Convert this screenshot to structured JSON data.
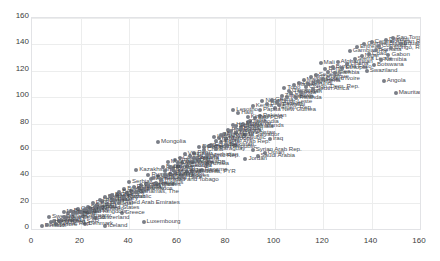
{
  "chart": {
    "title": "",
    "background": "#ffffff",
    "marker_color": "#6f737d",
    "grid_color": "#eceded",
    "label_color": "#4a4d55"
  },
  "chart_data": {
    "type": "scatter",
    "title": "",
    "xlabel": "",
    "ylabel": "",
    "xlim": [
      0,
      160
    ],
    "ylim": [
      0,
      160
    ],
    "xticks": [
      0,
      20,
      40,
      60,
      80,
      100,
      120,
      140,
      160
    ],
    "yticks": [
      0,
      20,
      40,
      60,
      80,
      100,
      120,
      140,
      160
    ],
    "grid": true,
    "legend": "none",
    "series": [
      {
        "name": "Countries",
        "points": [
          {
            "label": "Finland",
            "x": 4,
            "y": 2
          },
          {
            "label": "Iceland",
            "x": 30,
            "y": 2
          },
          {
            "label": "Denmark",
            "x": 22,
            "y": 4
          },
          {
            "label": "Korea, Rep.",
            "x": 10,
            "y": 4
          },
          {
            "label": "Luxembourg",
            "x": 46,
            "y": 5
          },
          {
            "label": "Switzerland",
            "x": 26,
            "y": 8
          },
          {
            "label": "Germany",
            "x": 21,
            "y": 10
          },
          {
            "label": "Austria",
            "x": 15,
            "y": 12
          },
          {
            "label": "Greece",
            "x": 37,
            "y": 12
          },
          {
            "label": "Czech Republic",
            "x": 19,
            "y": 15
          },
          {
            "label": "Netherlands",
            "x": 13,
            "y": 13
          },
          {
            "label": "Sweden",
            "x": 7,
            "y": 9
          },
          {
            "label": "Norway",
            "x": 9,
            "y": 6
          },
          {
            "label": "Japan",
            "x": 12,
            "y": 7
          },
          {
            "label": "Italy",
            "x": 24,
            "y": 16
          },
          {
            "label": "Spain",
            "x": 27,
            "y": 18
          },
          {
            "label": "Portugal",
            "x": 31,
            "y": 19
          },
          {
            "label": "Ireland",
            "x": 17,
            "y": 11
          },
          {
            "label": "Belgium",
            "x": 16,
            "y": 14
          },
          {
            "label": "France",
            "x": 18,
            "y": 12
          },
          {
            "label": "United Kingdom",
            "x": 20,
            "y": 13
          },
          {
            "label": "Slovenia",
            "x": 23,
            "y": 17
          },
          {
            "label": "Poland",
            "x": 29,
            "y": 21
          },
          {
            "label": "Estonia",
            "x": 25,
            "y": 20
          },
          {
            "label": "Hungary",
            "x": 33,
            "y": 23
          },
          {
            "label": "Slovak Republic",
            "x": 30,
            "y": 24
          },
          {
            "label": "Croatia",
            "x": 35,
            "y": 26
          },
          {
            "label": "Lithuania",
            "x": 28,
            "y": 22
          },
          {
            "label": "Latvia",
            "x": 32,
            "y": 25
          },
          {
            "label": "Chile",
            "x": 41,
            "y": 29
          },
          {
            "label": "Uruguay",
            "x": 44,
            "y": 31
          },
          {
            "label": "Argentina",
            "x": 47,
            "y": 34
          },
          {
            "label": "Cuba",
            "x": 39,
            "y": 27
          },
          {
            "label": "Costa Rica",
            "x": 45,
            "y": 33
          },
          {
            "label": "Bulgaria",
            "x": 38,
            "y": 30
          },
          {
            "label": "Romania",
            "x": 42,
            "y": 32
          },
          {
            "label": "Serbia",
            "x": 40,
            "y": 36
          },
          {
            "label": "Montenegro",
            "x": 49,
            "y": 38
          },
          {
            "label": "Belarus",
            "x": 36,
            "y": 28
          },
          {
            "label": "Russian Federation",
            "x": 48,
            "y": 41
          },
          {
            "label": "Kazakhstan",
            "x": 43,
            "y": 45
          },
          {
            "label": "Ukraine",
            "x": 52,
            "y": 40
          },
          {
            "label": "Uzbekistan",
            "x": 60,
            "y": 48
          },
          {
            "label": "Macedonia, FYR",
            "x": 64,
            "y": 43
          },
          {
            "label": "Albania",
            "x": 57,
            "y": 42
          },
          {
            "label": "Turkey",
            "x": 55,
            "y": 44
          },
          {
            "label": "Mexico",
            "x": 58,
            "y": 46
          },
          {
            "label": "Brazil",
            "x": 54,
            "y": 47
          },
          {
            "label": "Tunisia",
            "x": 72,
            "y": 49
          },
          {
            "label": "Panama",
            "x": 70,
            "y": 45
          },
          {
            "label": "Jamaica",
            "x": 66,
            "y": 44
          },
          {
            "label": "Venezuela, RB",
            "x": 62,
            "y": 50
          },
          {
            "label": "Thailand",
            "x": 59,
            "y": 52
          },
          {
            "label": "Colombia",
            "x": 61,
            "y": 54
          },
          {
            "label": "Malaysia",
            "x": 56,
            "y": 51
          },
          {
            "label": "Algeria",
            "x": 68,
            "y": 53
          },
          {
            "label": "Iran, Islamic Rep.",
            "x": 65,
            "y": 55
          },
          {
            "label": "Peru",
            "x": 67,
            "y": 58
          },
          {
            "label": "China",
            "x": 71,
            "y": 60
          },
          {
            "label": "Vietnam",
            "x": 63,
            "y": 57
          },
          {
            "label": "Dominican Republic",
            "x": 69,
            "y": 62
          },
          {
            "label": "Ecuador",
            "x": 74,
            "y": 64
          },
          {
            "label": "Mongolia",
            "x": 52,
            "y": 66
          },
          {
            "label": "Paraguay",
            "x": 76,
            "y": 61
          },
          {
            "label": "Sri Lanka",
            "x": 73,
            "y": 63
          },
          {
            "label": "Egypt, Arab Rep.",
            "x": 78,
            "y": 66
          },
          {
            "label": "Morocco",
            "x": 80,
            "y": 68
          },
          {
            "label": "Indonesia",
            "x": 75,
            "y": 70
          },
          {
            "label": "El Salvador",
            "x": 88,
            "y": 71
          },
          {
            "label": "Turkmenistan",
            "x": 84,
            "y": 73
          },
          {
            "label": "Philippines",
            "x": 81,
            "y": 75
          },
          {
            "label": "Guatemala",
            "x": 86,
            "y": 77
          },
          {
            "label": "Honduras",
            "x": 83,
            "y": 79
          },
          {
            "label": "Bolivia",
            "x": 79,
            "y": 72
          },
          {
            "label": "Nicaragua",
            "x": 82,
            "y": 74
          },
          {
            "label": "Kyrgyz Republic",
            "x": 77,
            "y": 69
          },
          {
            "label": "India",
            "x": 90,
            "y": 82
          },
          {
            "label": "Lao PDR",
            "x": 92,
            "y": 84
          },
          {
            "label": "Cambodia",
            "x": 89,
            "y": 81
          },
          {
            "label": "Myanmar",
            "x": 87,
            "y": 80
          },
          {
            "label": "Pakistan",
            "x": 94,
            "y": 86
          },
          {
            "label": "Haiti",
            "x": 85,
            "y": 88
          },
          {
            "label": "Lesotho",
            "x": 83,
            "y": 90
          },
          {
            "label": "Kenya",
            "x": 91,
            "y": 93
          },
          {
            "label": "Bangladesh",
            "x": 97,
            "y": 95
          },
          {
            "label": "Nepal",
            "x": 95,
            "y": 97
          },
          {
            "label": "Yemen, Rep.",
            "x": 100,
            "y": 92
          },
          {
            "label": "Ghana",
            "x": 99,
            "y": 98
          },
          {
            "label": "Zimbabwe",
            "x": 103,
            "y": 101
          },
          {
            "label": "Tanzania",
            "x": 105,
            "y": 100
          },
          {
            "label": "Uganda",
            "x": 107,
            "y": 103
          },
          {
            "label": "Rwanda",
            "x": 109,
            "y": 99
          },
          {
            "label": "Cameroon",
            "x": 106,
            "y": 105
          },
          {
            "label": "Togo",
            "x": 104,
            "y": 107
          },
          {
            "label": "Sudan",
            "x": 111,
            "y": 104
          },
          {
            "label": "Malawi",
            "x": 108,
            "y": 109
          },
          {
            "label": "Zambia",
            "x": 110,
            "y": 111
          },
          {
            "label": "Congo, Dem. Rep.",
            "x": 113,
            "y": 108
          },
          {
            "label": "South Africa",
            "x": 116,
            "y": 106
          },
          {
            "label": "Madagascar",
            "x": 112,
            "y": 113
          },
          {
            "label": "Mozambique",
            "x": 115,
            "y": 115
          },
          {
            "label": "Burundi",
            "x": 114,
            "y": 110
          },
          {
            "label": "Nigeria",
            "x": 118,
            "y": 112
          },
          {
            "label": "Senegal",
            "x": 117,
            "y": 117
          },
          {
            "label": "Cote d'Ivoire",
            "x": 120,
            "y": 114
          },
          {
            "label": "Guinea",
            "x": 122,
            "y": 119
          },
          {
            "label": "Benin",
            "x": 121,
            "y": 121
          },
          {
            "label": "Burkina Faso",
            "x": 124,
            "y": 123
          },
          {
            "label": "Mali",
            "x": 119,
            "y": 126
          },
          {
            "label": "Afghanistan",
            "x": 126,
            "y": 127
          },
          {
            "label": "Ethiopia",
            "x": 128,
            "y": 122
          },
          {
            "label": "Liberia",
            "x": 130,
            "y": 125
          },
          {
            "label": "Sierra Leone",
            "x": 133,
            "y": 129
          },
          {
            "label": "Niger",
            "x": 136,
            "y": 131
          },
          {
            "label": "Chad",
            "x": 139,
            "y": 133
          },
          {
            "label": "Somalia",
            "x": 142,
            "y": 136
          },
          {
            "label": "Angola",
            "x": 145,
            "y": 112
          },
          {
            "label": "Mauritania",
            "x": 150,
            "y": 103
          },
          {
            "label": "Gambia, The",
            "x": 131,
            "y": 135
          },
          {
            "label": "Eritrea",
            "x": 134,
            "y": 138
          },
          {
            "label": "Guinea-Bissau",
            "x": 137,
            "y": 140
          },
          {
            "label": "Central African Rep",
            "x": 140,
            "y": 142
          },
          {
            "label": "Comoros",
            "x": 143,
            "y": 139
          },
          {
            "label": "Djibouti",
            "x": 146,
            "y": 143
          },
          {
            "label": "Congo, Rep.",
            "x": 148,
            "y": 137
          },
          {
            "label": "Gabon",
            "x": 147,
            "y": 132
          },
          {
            "label": "Namibia",
            "x": 144,
            "y": 128
          },
          {
            "label": "Botswana",
            "x": 141,
            "y": 124
          },
          {
            "label": "Swaziland",
            "x": 138,
            "y": 120
          },
          {
            "label": "Equatorial Guinea",
            "x": 152,
            "y": 140
          },
          {
            "label": "Sao Tome",
            "x": 149,
            "y": 145
          },
          {
            "label": "Oman",
            "x": 96,
            "y": 58
          },
          {
            "label": "Saudi Arabia",
            "x": 93,
            "y": 55
          },
          {
            "label": "Jordan",
            "x": 88,
            "y": 53
          },
          {
            "label": "Syrian Arab Rep.",
            "x": 91,
            "y": 60
          },
          {
            "label": "Iraq",
            "x": 98,
            "y": 68
          },
          {
            "label": "Azerbaijan",
            "x": 72,
            "y": 56
          },
          {
            "label": "Armenia",
            "x": 66,
            "y": 51
          },
          {
            "label": "Georgia",
            "x": 64,
            "y": 48
          },
          {
            "label": "Moldova",
            "x": 59,
            "y": 43
          },
          {
            "label": "Bosnia and Herz.",
            "x": 50,
            "y": 39
          },
          {
            "label": "Tajikistan",
            "x": 80,
            "y": 64
          },
          {
            "label": "Bhutan",
            "x": 86,
            "y": 76
          },
          {
            "label": "Maldives",
            "x": 62,
            "y": 40
          },
          {
            "label": "Mauritius",
            "x": 51,
            "y": 35
          },
          {
            "label": "Trinidad and Tobago",
            "x": 53,
            "y": 37
          },
          {
            "label": "Barbados",
            "x": 46,
            "y": 30
          },
          {
            "label": "Bahamas, The",
            "x": 43,
            "y": 28
          },
          {
            "label": "Qatar",
            "x": 34,
            "y": 22
          },
          {
            "label": "Kuwait",
            "x": 38,
            "y": 24
          },
          {
            "label": "United Arab Emirates",
            "x": 36,
            "y": 20
          },
          {
            "label": "Israel",
            "x": 22,
            "y": 15
          },
          {
            "label": "Cyprus",
            "x": 26,
            "y": 17
          },
          {
            "label": "Malta",
            "x": 24,
            "y": 14
          },
          {
            "label": "New Zealand",
            "x": 14,
            "y": 8
          },
          {
            "label": "Australia",
            "x": 11,
            "y": 6
          },
          {
            "label": "Canada",
            "x": 13,
            "y": 9
          },
          {
            "label": "United States",
            "x": 28,
            "y": 16
          },
          {
            "label": "Singapore",
            "x": 6,
            "y": 3
          },
          {
            "label": "Hong Kong SAR",
            "x": 8,
            "y": 5
          },
          {
            "label": "Brunei",
            "x": 33,
            "y": 26
          },
          {
            "label": "Seychelles",
            "x": 48,
            "y": 33
          },
          {
            "label": "Fiji",
            "x": 69,
            "y": 52
          },
          {
            "label": "Samoa",
            "x": 57,
            "y": 47
          },
          {
            "label": "Vanuatu",
            "x": 76,
            "y": 67
          },
          {
            "label": "Solomon Islands",
            "x": 84,
            "y": 78
          },
          {
            "label": "Papua New Guinea",
            "x": 94,
            "y": 90
          },
          {
            "label": "Timor-Leste",
            "x": 101,
            "y": 96
          },
          {
            "label": "Gaza",
            "x": 71,
            "y": 62
          },
          {
            "label": "Belize",
            "x": 55,
            "y": 41
          },
          {
            "label": "Suriname",
            "x": 58,
            "y": 45
          },
          {
            "label": "Guyana",
            "x": 67,
            "y": 54
          },
          {
            "label": "Cape Verde",
            "x": 60,
            "y": 50
          },
          {
            "label": "Eswatini",
            "x": 102,
            "y": 94
          },
          {
            "label": "Gambia",
            "x": 125,
            "y": 118
          },
          {
            "label": "Kiribati",
            "x": 89,
            "y": 85
          },
          {
            "label": "Micronesia",
            "x": 78,
            "y": 71
          }
        ]
      }
    ]
  }
}
